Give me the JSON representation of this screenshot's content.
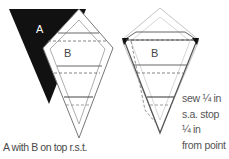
{
  "diagram": {
    "left_figure": {
      "piece_a_label": "A",
      "piece_b_label": "B",
      "caption": "A with B on top r.s.t."
    },
    "right_figure": {
      "piece_b_label": "B",
      "note_lines": [
        "sew ¼ in",
        "s.a. stop",
        "¼ in",
        "from point"
      ]
    },
    "colors": {
      "piece_a_fill": "#111111",
      "outline": "#555555",
      "faded_outline": "#bbbbbb",
      "text": "#555555"
    }
  }
}
